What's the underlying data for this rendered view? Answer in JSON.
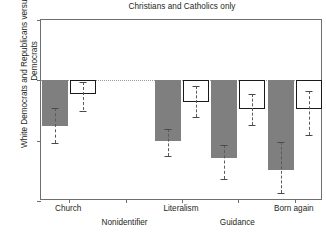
{
  "chart_data": {
    "type": "bar",
    "title": "Christians and Catholics only",
    "xlabel": "",
    "ylabel": "White Democrats and Republicans versus black Democrats",
    "ylim": [
      -0.5,
      0.25
    ],
    "yticks": [
      0.25,
      0,
      -0.25,
      -0.5
    ],
    "ytick_labels": [
      ".25",
      "0",
      "-.25",
      "-.5"
    ],
    "grid": false,
    "zero_reference_line": true,
    "legend": "none",
    "categories": [
      "Church",
      "Nonidentifier",
      "Literalism",
      "Guidance",
      "Born again"
    ],
    "series": [
      {
        "name": "White Democrats",
        "style": "solid-gray",
        "color": "#7f7f7f",
        "values": [
          -0.19,
          null,
          -0.25,
          -0.32,
          -0.37
        ],
        "ci_low": [
          -0.26,
          null,
          -0.315,
          -0.41,
          -0.465
        ],
        "ci_high": [
          -0.115,
          null,
          -0.2,
          -0.27,
          -0.255
        ]
      },
      {
        "name": "Republicans",
        "style": "hollow-outline",
        "color": "#ffffff",
        "values": [
          -0.055,
          null,
          -0.09,
          -0.12,
          -0.12
        ],
        "ci_low": [
          -0.125,
          null,
          -0.15,
          -0.185,
          -0.225
        ],
        "ci_high": [
          -0.005,
          null,
          -0.025,
          -0.055,
          -0.045
        ]
      }
    ]
  },
  "axis": {
    "y_tick_labels": [
      ".25",
      "0",
      "-.25",
      "-.5"
    ],
    "x_tick_labels": [
      "Church",
      "Nonidentifier",
      "Literalism",
      "Guidance",
      "Born again"
    ]
  }
}
